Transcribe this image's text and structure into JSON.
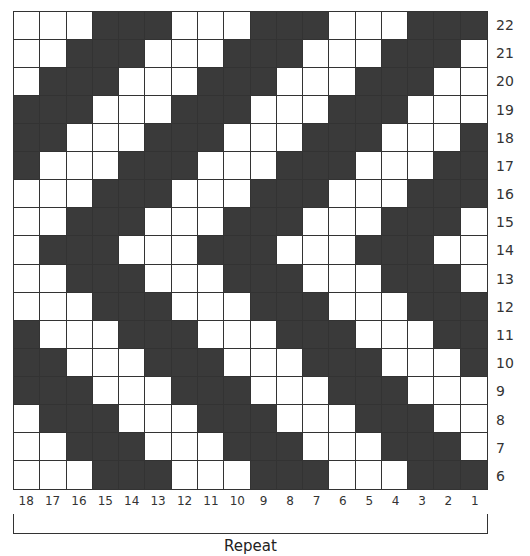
{
  "chart": {
    "type": "knitting-chart",
    "columns": 18,
    "rows": 17,
    "colors": {
      "dark": "#3a3a3a",
      "light": "#ffffff",
      "grid": "#333333"
    },
    "row_labels": [
      "22",
      "21",
      "20",
      "19",
      "18",
      "17",
      "16",
      "15",
      "14",
      "13",
      "12",
      "11",
      "10",
      "9",
      "8",
      "7",
      "6"
    ],
    "col_labels": [
      "18",
      "17",
      "16",
      "15",
      "14",
      "13",
      "12",
      "11",
      "10",
      "9",
      "8",
      "7",
      "6",
      "5",
      "4",
      "3",
      "2",
      "1"
    ],
    "repeat_label": "Repeat",
    "cells": [
      [
        0,
        0,
        0,
        1,
        1,
        1,
        0,
        0,
        0,
        1,
        1,
        1,
        0,
        0,
        0,
        1,
        1,
        1
      ],
      [
        0,
        0,
        1,
        1,
        1,
        0,
        0,
        0,
        1,
        1,
        1,
        0,
        0,
        0,
        1,
        1,
        1,
        0
      ],
      [
        0,
        1,
        1,
        1,
        0,
        0,
        0,
        1,
        1,
        1,
        0,
        0,
        0,
        1,
        1,
        1,
        0,
        0
      ],
      [
        1,
        1,
        1,
        0,
        0,
        0,
        1,
        1,
        1,
        0,
        0,
        0,
        1,
        1,
        1,
        0,
        0,
        0
      ],
      [
        1,
        1,
        0,
        0,
        0,
        1,
        1,
        1,
        0,
        0,
        0,
        1,
        1,
        1,
        0,
        0,
        0,
        1
      ],
      [
        1,
        0,
        0,
        0,
        1,
        1,
        1,
        0,
        0,
        0,
        1,
        1,
        1,
        0,
        0,
        0,
        1,
        1
      ],
      [
        0,
        0,
        0,
        1,
        1,
        1,
        0,
        0,
        0,
        1,
        1,
        1,
        0,
        0,
        0,
        1,
        1,
        1
      ],
      [
        0,
        0,
        1,
        1,
        1,
        0,
        0,
        0,
        1,
        1,
        1,
        0,
        0,
        0,
        1,
        1,
        1,
        0
      ],
      [
        0,
        1,
        1,
        1,
        0,
        0,
        0,
        1,
        1,
        1,
        0,
        0,
        0,
        1,
        1,
        1,
        0,
        0
      ],
      [
        0,
        0,
        1,
        1,
        1,
        0,
        0,
        0,
        1,
        1,
        1,
        0,
        0,
        0,
        1,
        1,
        1,
        0
      ],
      [
        0,
        0,
        0,
        1,
        1,
        1,
        0,
        0,
        0,
        1,
        1,
        1,
        0,
        0,
        0,
        1,
        1,
        1
      ],
      [
        1,
        0,
        0,
        0,
        1,
        1,
        1,
        0,
        0,
        0,
        1,
        1,
        1,
        0,
        0,
        0,
        1,
        1
      ],
      [
        1,
        1,
        0,
        0,
        0,
        1,
        1,
        1,
        0,
        0,
        0,
        1,
        1,
        1,
        0,
        0,
        0,
        1
      ],
      [
        1,
        1,
        1,
        0,
        0,
        0,
        1,
        1,
        1,
        0,
        0,
        0,
        1,
        1,
        1,
        0,
        0,
        0
      ],
      [
        0,
        1,
        1,
        1,
        0,
        0,
        0,
        1,
        1,
        1,
        0,
        0,
        0,
        1,
        1,
        1,
        0,
        0
      ],
      [
        0,
        0,
        1,
        1,
        1,
        0,
        0,
        0,
        1,
        1,
        1,
        0,
        0,
        0,
        1,
        1,
        1,
        0
      ],
      [
        0,
        0,
        0,
        1,
        1,
        1,
        0,
        0,
        0,
        1,
        1,
        1,
        0,
        0,
        0,
        1,
        1,
        1
      ]
    ]
  }
}
